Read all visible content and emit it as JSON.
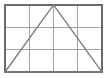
{
  "figure": {
    "canvas": {
      "width": 107,
      "height": 78,
      "background": "#ffffff"
    },
    "grid": {
      "label": "grid",
      "columns": 4,
      "rows": 3,
      "x_lines": [
        5,
        29.25,
        53.5,
        77.75,
        102
      ],
      "y_lines": [
        5,
        27.3,
        49.6,
        72
      ],
      "line_color": "#9a9a9a",
      "line_width": 0.9
    },
    "border": {
      "label": "outer rectangle",
      "x": 5,
      "y": 5,
      "width": 97,
      "height": 67,
      "stroke_color": "#6b6b6b",
      "stroke_width": 1.6,
      "fill": "none"
    },
    "triangle": {
      "label": "triangle",
      "points": "5,72 53.5,5 102,72",
      "apex": [
        53.5,
        5
      ],
      "base_left": [
        5,
        72
      ],
      "base_right": [
        102,
        72
      ],
      "stroke_color": "#7b7b7b",
      "stroke_width": 1.3,
      "fill": "none"
    }
  }
}
